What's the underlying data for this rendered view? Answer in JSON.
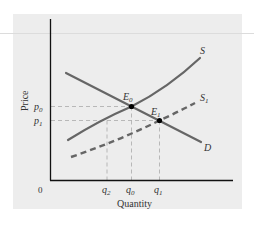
{
  "diagram": {
    "type": "supply-demand",
    "axes": {
      "y_label": "Price",
      "x_label": "Quantity",
      "origin_label": "0"
    },
    "price_levels": [
      {
        "id": "p0",
        "base": "p",
        "sub": "0"
      },
      {
        "id": "p1",
        "base": "p",
        "sub": "1"
      }
    ],
    "quantity_levels": [
      {
        "id": "q2",
        "base": "q",
        "sub": "2"
      },
      {
        "id": "q0",
        "base": "q",
        "sub": "0"
      },
      {
        "id": "q1",
        "base": "q",
        "sub": "1"
      }
    ],
    "curves": {
      "supply": {
        "label": "S",
        "style": "solid"
      },
      "supply_shifted": {
        "base": "S",
        "sub": "1",
        "style": "dashed"
      },
      "demand": {
        "label": "D",
        "style": "solid"
      }
    },
    "equilibria": [
      {
        "id": "E0",
        "base": "E",
        "sub": "0"
      },
      {
        "id": "E1",
        "base": "E",
        "sub": "1"
      }
    ],
    "colors": {
      "panel_bg": "#ededed",
      "axis": "#111111",
      "curve": "#666666",
      "guide": "#aaaaaa",
      "point": "#000000",
      "text": "#333333"
    }
  }
}
